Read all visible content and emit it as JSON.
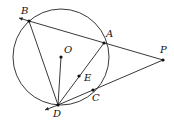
{
  "diagram": {
    "type": "geometry",
    "circle": {
      "center": "O",
      "cx": 61,
      "cy": 57,
      "r": 48
    },
    "points": [
      {
        "name": "B",
        "x": 29,
        "y": 21,
        "lx": 21,
        "ly": 14
      },
      {
        "name": "A",
        "x": 104,
        "y": 43,
        "lx": 106,
        "ly": 37
      },
      {
        "name": "P",
        "x": 163,
        "y": 60,
        "lx": 160,
        "ly": 53
      },
      {
        "name": "O",
        "x": 61,
        "y": 57,
        "lx": 64,
        "ly": 53
      },
      {
        "name": "E",
        "x": 79,
        "y": 76,
        "lx": 84,
        "ly": 81
      },
      {
        "name": "C",
        "x": 93,
        "y": 90,
        "lx": 92,
        "ly": 101
      },
      {
        "name": "D",
        "x": 58,
        "y": 105,
        "lx": 53,
        "ly": 117
      }
    ],
    "segments": [
      [
        "B",
        "P"
      ],
      [
        "B",
        "D"
      ],
      [
        "O",
        "D"
      ],
      [
        "D",
        "A"
      ],
      [
        "D",
        "P"
      ]
    ],
    "arrows": [
      {
        "from": "P",
        "to": "B",
        "ex": 19,
        "ey": 18
      },
      {
        "from": "P",
        "to": "D",
        "ex": 45,
        "ey": 110
      }
    ]
  }
}
